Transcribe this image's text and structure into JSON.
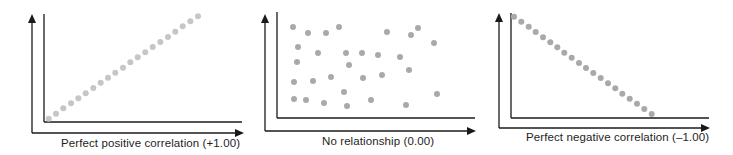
{
  "chart_data": [
    {
      "type": "scatter",
      "title": "Perfect positive correlation (+1.00)",
      "xlabel": "Perfect positive correlation (+1.00)",
      "ylabel": "",
      "correlation": 1.0,
      "grid": false,
      "legend": null,
      "point_color": "#c6c6c6",
      "points_px": [
        [
          48.7,
          118.7
        ],
        [
          56,
          113.7
        ],
        [
          63.3,
          108.3
        ],
        [
          71,
          103.3
        ],
        [
          78.3,
          98.3
        ],
        [
          85.7,
          93.3
        ],
        [
          93.3,
          88
        ],
        [
          100.7,
          82.7
        ],
        [
          108,
          77.7
        ],
        [
          115.3,
          72.7
        ],
        [
          123,
          67.7
        ],
        [
          130.3,
          62.3
        ],
        [
          137.7,
          57.3
        ],
        [
          145.3,
          52.3
        ],
        [
          152.7,
          47
        ],
        [
          160.3,
          42
        ],
        [
          168,
          37
        ],
        [
          175.3,
          31.7
        ],
        [
          182.7,
          26.3
        ],
        [
          190.3,
          21.3
        ],
        [
          198,
          16.3
        ]
      ],
      "x": [
        1,
        2,
        3,
        4,
        5,
        6,
        7,
        8,
        9,
        10,
        11,
        12,
        13,
        14,
        15,
        16,
        17,
        18,
        19,
        20,
        21
      ],
      "y": [
        1,
        2,
        3,
        4,
        5,
        6,
        7,
        8,
        9,
        10,
        11,
        12,
        13,
        14,
        15,
        16,
        17,
        18,
        19,
        20,
        21
      ]
    },
    {
      "type": "scatter",
      "title": "No relationship (0.00)",
      "xlabel": "No relationship (0.00)",
      "ylabel": "",
      "correlation": 0.0,
      "grid": false,
      "legend": null,
      "point_color": "#a9a9a9",
      "points_px": [
        [
          293,
          27
        ],
        [
          308,
          33
        ],
        [
          326,
          33
        ],
        [
          339,
          27
        ],
        [
          298,
          47
        ],
        [
          318,
          53
        ],
        [
          346,
          53
        ],
        [
          362,
          53
        ],
        [
          378,
          55
        ],
        [
          297,
          62
        ],
        [
          349,
          65
        ],
        [
          294,
          82
        ],
        [
          313,
          81
        ],
        [
          331,
          77
        ],
        [
          363,
          78
        ],
        [
          344,
          92
        ],
        [
          294,
          99
        ],
        [
          306,
          100
        ],
        [
          324,
          103
        ],
        [
          347,
          106
        ],
        [
          371,
          100
        ],
        [
          387,
          32
        ],
        [
          418,
          28
        ],
        [
          411,
          35
        ],
        [
          434,
          43
        ],
        [
          400,
          57
        ],
        [
          409,
          70
        ],
        [
          382,
          75
        ],
        [
          437,
          94
        ],
        [
          406,
          105
        ]
      ]
    },
    {
      "type": "scatter",
      "title": "Perfect negative correlation (–1.00)",
      "xlabel": "Perfect negative correlation (–1.00)",
      "ylabel": "",
      "correlation": -1.0,
      "grid": false,
      "legend": null,
      "point_color": "#a9a9a9",
      "points_px": [
        [
          514,
          16.7
        ],
        [
          521.3,
          21.7
        ],
        [
          528.7,
          26.7
        ],
        [
          535.7,
          32
        ],
        [
          543,
          37.3
        ],
        [
          550.3,
          42.3
        ],
        [
          557.3,
          47.3
        ],
        [
          564.3,
          52.7
        ],
        [
          571.7,
          57.7
        ],
        [
          579,
          63
        ],
        [
          586,
          68
        ],
        [
          593.3,
          73
        ],
        [
          600.7,
          78
        ],
        [
          608,
          83.3
        ],
        [
          615.3,
          88.3
        ],
        [
          622.3,
          93.7
        ],
        [
          629.7,
          98.7
        ],
        [
          637,
          103.7
        ],
        [
          644.3,
          109
        ],
        [
          651.7,
          114
        ]
      ],
      "x": [
        1,
        2,
        3,
        4,
        5,
        6,
        7,
        8,
        9,
        10,
        11,
        12,
        13,
        14,
        15,
        16,
        17,
        18,
        19,
        20
      ],
      "y": [
        20,
        19,
        18,
        17,
        16,
        15,
        14,
        13,
        12,
        11,
        10,
        9,
        8,
        7,
        6,
        5,
        4,
        3,
        2,
        1
      ]
    }
  ],
  "panels": [
    {
      "caption": "Perfect positive correlation (+1.00)",
      "outer_axis": {
        "x": 32,
        "top": 14,
        "y": 133,
        "right": 244
      },
      "inner_axis": {
        "x": 44,
        "top": 14,
        "y": 122,
        "right": 242
      },
      "caption_pos": {
        "left": 61,
        "top": 137
      }
    },
    {
      "caption": "No relationship (0.00)",
      "outer_axis": {
        "x": 265,
        "top": 14,
        "y": 131,
        "right": 476
      },
      "inner_axis": {
        "x": 277,
        "top": 12,
        "y": 118,
        "right": 475
      },
      "caption_pos": {
        "left": 322,
        "top": 135
      }
    },
    {
      "caption": "Perfect negative correlation (–1.00)",
      "outer_axis": {
        "x": 499,
        "top": 13,
        "y": 128,
        "right": 710
      },
      "inner_axis": {
        "x": 511,
        "top": 13,
        "y": 118,
        "right": 709
      },
      "caption_pos": {
        "left": 526,
        "top": 131
      }
    }
  ],
  "colors": {
    "axis": "#1a1a1a",
    "text": "#1e1e1e"
  }
}
